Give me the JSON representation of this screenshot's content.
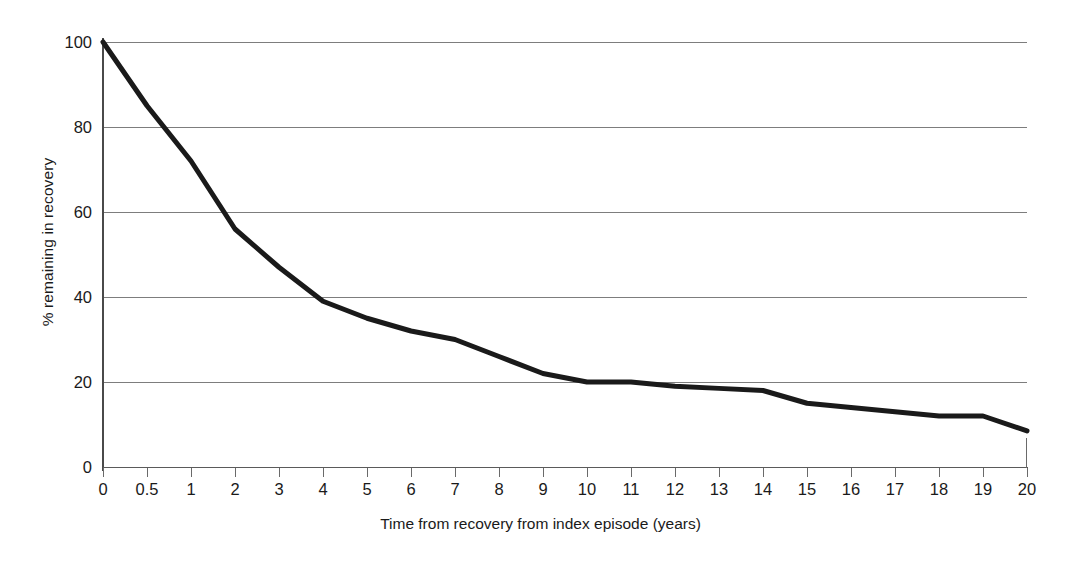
{
  "chart_data": {
    "type": "line",
    "title": "",
    "subtitle": "",
    "xlabel": "Time from recovery from index episode (years)",
    "ylabel": "% remaining in recovery",
    "categories": [
      "0",
      "0.5",
      "1",
      "2",
      "3",
      "4",
      "5",
      "6",
      "7",
      "8",
      "9",
      "10",
      "11",
      "12",
      "13",
      "14",
      "15",
      "16",
      "17",
      "18",
      "19",
      "20"
    ],
    "x": [
      0,
      0.5,
      1,
      2,
      3,
      4,
      5,
      6,
      7,
      8,
      9,
      10,
      11,
      12,
      13,
      14,
      15,
      16,
      17,
      18,
      19,
      20
    ],
    "values": [
      100,
      85,
      72,
      56,
      47,
      39,
      35,
      32,
      30,
      26,
      22,
      20,
      20,
      19,
      18.5,
      18,
      15,
      14,
      13,
      12,
      12,
      8.5
    ],
    "series": [
      {
        "name": "% remaining in recovery",
        "values": [
          100,
          85,
          72,
          56,
          47,
          39,
          35,
          32,
          30,
          26,
          22,
          20,
          20,
          19,
          18.5,
          18,
          15,
          14,
          13,
          12,
          12,
          8.5
        ],
        "color": "#1a1a1a"
      }
    ],
    "ylim": [
      0,
      100
    ],
    "yticks": [
      0,
      20,
      40,
      60,
      80,
      100
    ],
    "ytick_labels": [
      "0",
      "20",
      "40",
      "60",
      "80",
      "100"
    ],
    "grid": "horizontal",
    "legend": "none",
    "line_width": 5,
    "line_color": "#1a1a1a",
    "background": "#ffffff",
    "gridline_color": "#7d7d7d",
    "axis_color": "#5a5a5a",
    "annotations": []
  }
}
